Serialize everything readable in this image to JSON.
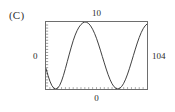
{
  "panel": {
    "letter": "(C)"
  },
  "labels": {
    "top": "10",
    "left": "0",
    "right": "104",
    "bottom": "0"
  },
  "style": {
    "frame_color": "#6e6e6e",
    "curve_color": "#262626",
    "background": "#ffffff",
    "text_color": "#2b2b2b"
  },
  "chart_data": {
    "type": "line",
    "title": "(C)",
    "xlabel": "0",
    "ylabel": "0",
    "top_label": "10",
    "right_label": "104",
    "grid": false,
    "legend": null,
    "xlim": [
      0,
      104
    ],
    "ylim": [
      0,
      10
    ],
    "series": [
      {
        "name": "oscillation",
        "x": [
          0,
          2,
          4,
          6,
          8,
          10,
          12,
          14,
          16,
          18,
          20,
          22,
          24,
          26,
          28,
          30,
          32,
          34,
          36,
          38,
          40,
          42,
          44,
          46,
          48,
          50,
          52,
          54,
          56,
          58,
          60,
          62,
          64,
          66,
          68,
          70,
          72,
          74,
          76,
          78,
          80,
          82,
          84,
          86,
          88,
          90,
          92,
          94,
          96,
          98,
          100,
          102,
          104
        ],
        "y": [
          3.06,
          2.04,
          1.18,
          0.52,
          0.13,
          0.0,
          0.13,
          0.52,
          1.18,
          2.04,
          3.06,
          4.13,
          5.21,
          6.25,
          7.21,
          8.04,
          8.71,
          9.24,
          9.62,
          9.88,
          10.0,
          9.95,
          9.76,
          9.41,
          8.92,
          8.3,
          7.56,
          6.71,
          5.8,
          4.85,
          3.9,
          2.98,
          2.13,
          1.39,
          0.79,
          0.35,
          0.09,
          0.01,
          0.11,
          0.39,
          0.85,
          1.47,
          2.23,
          3.1,
          4.04,
          5.0,
          5.96,
          6.87,
          7.69,
          8.41,
          8.99,
          9.42,
          9.7
        ]
      }
    ],
    "axis_ticks": {
      "left_minor_tick_count": 22,
      "bottom_minor_tick_count": 26
    }
  }
}
